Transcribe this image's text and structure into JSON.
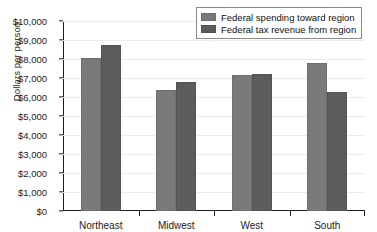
{
  "chart_data": {
    "type": "bar",
    "title": "",
    "xlabel": "",
    "ylabel": "Dollars per person",
    "ylim": [
      0,
      10000
    ],
    "ytick_step": 1000,
    "grid": true,
    "legend_position": "top-right",
    "categories": [
      "Northeast",
      "Midwest",
      "West",
      "South"
    ],
    "series": [
      {
        "name": "Federal spending toward region",
        "color": "#7a7a7a",
        "values": [
          8050,
          6350,
          7180,
          7800
        ]
      },
      {
        "name": "Federal tax revenue from region",
        "color": "#5c5c5c",
        "values": [
          8750,
          6780,
          7230,
          6240
        ]
      }
    ],
    "ytick_labels": [
      "$0",
      "$1,000",
      "$2,000",
      "$3,000",
      "$4,000",
      "$5,000",
      "$6,000",
      "$7,000",
      "$8,000",
      "$9,000",
      "$10,000"
    ],
    "ytick_values": [
      0,
      1000,
      2000,
      3000,
      4000,
      5000,
      6000,
      7000,
      8000,
      9000,
      10000
    ]
  }
}
